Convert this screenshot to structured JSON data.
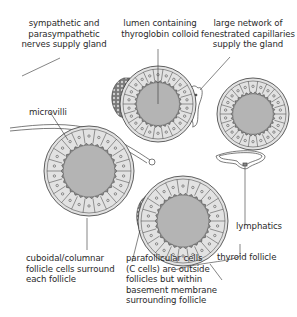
{
  "diagram": {
    "type": "anatomical-illustration",
    "colors": {
      "colloid": "#b4b4b4",
      "cell_ring": "#e2e2e2",
      "outline": "#3a3a3a",
      "c_cells": "#6a6a6a",
      "text": "#2a2a2a"
    },
    "labels": {
      "nerves": "sympathetic and\nparasympathetic\nnerves supply gland",
      "lumen": "lumen containing\nthyroglobin colloid",
      "capillaries": "large network of\nfenestrated capillaries\nsupply the gland",
      "microvilli": "microvilli",
      "lymphatics": "lymphatics",
      "thyroid_follicle": "thyroid follicle",
      "follicle_cells": "cuboidal/columnar\nfollicle cells surround\neach follicle",
      "parafollicular": "parafollicular cells\n(C cells) are outside\nfollicles but within\nbasement membrane\nsurrounding follicle"
    },
    "follicles": [
      {
        "name": "follicle-top",
        "cx": 158,
        "cy": 104,
        "r": 38,
        "c_cells": true
      },
      {
        "name": "follicle-right",
        "cx": 253,
        "cy": 114,
        "r": 36,
        "c_cells": false
      },
      {
        "name": "follicle-left",
        "cx": 89,
        "cy": 171,
        "r": 45,
        "c_cells": false
      },
      {
        "name": "follicle-bottom",
        "cx": 183,
        "cy": 221,
        "r": 45,
        "c_cells": true
      }
    ]
  }
}
